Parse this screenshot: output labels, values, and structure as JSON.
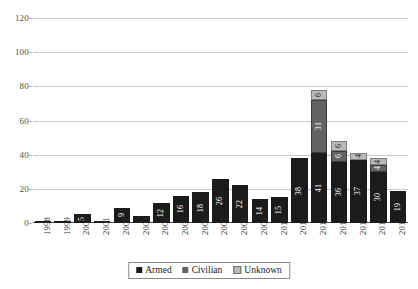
{
  "chart_data": {
    "type": "bar",
    "stacked": true,
    "title": "",
    "subtitle": "",
    "xlabel": "",
    "ylabel": "",
    "ylim": [
      0,
      120
    ],
    "yticks": [
      0,
      20,
      40,
      60,
      80,
      100,
      120
    ],
    "ytick_labels": [
      "0",
      "20",
      "40",
      "60",
      "80",
      "100",
      "120"
    ],
    "grid": true,
    "legend_position": "bottom-center",
    "categories": [
      "1998",
      "1999",
      "2000",
      "2001",
      "2002",
      "2003",
      "2004",
      "2005",
      "2006",
      "2007",
      "2008",
      "2009",
      "2010",
      "2011",
      "2012",
      "2013",
      "2014",
      "2015",
      "2016"
    ],
    "series": [
      {
        "name": "Armed",
        "color": "#1b1b1b",
        "values": [
          1,
          1,
          5,
          1,
          9,
          4,
          12,
          16,
          18,
          26,
          22,
          14,
          15,
          38,
          41,
          36,
          37,
          30,
          19
        ]
      },
      {
        "name": "Civilian",
        "color": "#636363",
        "values": [
          0,
          0,
          0,
          0,
          0,
          0,
          0,
          0,
          0,
          0,
          0,
          0,
          0,
          0,
          31,
          6,
          0,
          4,
          0
        ]
      },
      {
        "name": "Unknown",
        "color": "#b9b9b9",
        "values": [
          0,
          0,
          0,
          0,
          0,
          0,
          0,
          0,
          0,
          0,
          0,
          0,
          0,
          0,
          6,
          6,
          4,
          4,
          0
        ]
      }
    ],
    "visible_data_labels": {
      "Armed": [
        "",
        "",
        "5",
        "",
        "9",
        "",
        "12",
        "16",
        "18",
        "26",
        "22",
        "14",
        "15",
        "38",
        "41",
        "36",
        "37",
        "30",
        "19"
      ],
      "Civilian": [
        "",
        "",
        "",
        "",
        "",
        "",
        "",
        "",
        "",
        "",
        "",
        "",
        "",
        "",
        "31",
        "6",
        "",
        "4",
        ""
      ],
      "Unknown": [
        "",
        "",
        "",
        "",
        "",
        "",
        "",
        "",
        "",
        "",
        "",
        "",
        "",
        "",
        "6",
        "6",
        "4",
        "4",
        ""
      ]
    },
    "totals": [
      1,
      1,
      5,
      1,
      9,
      4,
      12,
      16,
      18,
      26,
      22,
      14,
      15,
      38,
      78,
      48,
      41,
      38,
      19
    ]
  },
  "legend": {
    "items": [
      {
        "label": "Armed",
        "swatch": "armed-swatch-icon"
      },
      {
        "label": "Civilian",
        "swatch": "civilian-swatch-icon"
      },
      {
        "label": "Unknown",
        "swatch": "unknown-swatch-icon"
      }
    ]
  },
  "colors": {
    "armed": "#1b1b1b",
    "civilian": "#636363",
    "unknown": "#b9b9b9",
    "gridline": "#c9c9c9",
    "axis": "#4a4a4a",
    "background": "#ffffff"
  }
}
